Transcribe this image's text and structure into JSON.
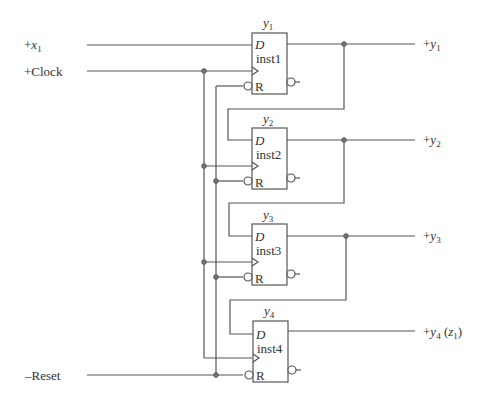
{
  "inputs": {
    "x1": {
      "prefix": "+",
      "var": "x",
      "sub": "1"
    },
    "clock": "+Clock",
    "reset": "–Reset"
  },
  "flipflops": [
    {
      "title_var": "y",
      "title_sub": "1",
      "d_label": "D",
      "name": "inst1",
      "r_label": "R"
    },
    {
      "title_var": "y",
      "title_sub": "2",
      "d_label": "D",
      "name": "inst2",
      "r_label": "R"
    },
    {
      "title_var": "y",
      "title_sub": "3",
      "d_label": "D",
      "name": "inst3",
      "r_label": "R"
    },
    {
      "title_var": "y",
      "title_sub": "4",
      "d_label": "D",
      "name": "inst4",
      "r_label": "R"
    }
  ],
  "outputs": [
    {
      "prefix": "+",
      "var": "y",
      "sub": "1",
      "suffix": ""
    },
    {
      "prefix": "+",
      "var": "y",
      "sub": "2",
      "suffix": ""
    },
    {
      "prefix": "+",
      "var": "y",
      "sub": "3",
      "suffix": ""
    },
    {
      "prefix": "+",
      "var": "y",
      "sub": "4",
      "suffix_open": " (",
      "suffix_var": "z",
      "suffix_sub": "1",
      "suffix_close": ")"
    }
  ],
  "colors": {
    "wire": "#555555",
    "text": "#333333",
    "background": "#ffffff"
  }
}
